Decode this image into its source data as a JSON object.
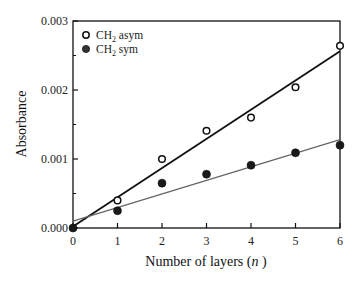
{
  "chart_data": {
    "type": "scatter",
    "title": "",
    "xlabel": "Number of layers (n)",
    "ylabel": "Absorbance",
    "xlim": [
      0,
      6
    ],
    "ylim": [
      0.0,
      0.003
    ],
    "x_ticks": [
      "0",
      "1",
      "2",
      "3",
      "4",
      "5",
      "6"
    ],
    "y_ticks": [
      "0.000",
      "0.001",
      "0.002",
      "0.003"
    ],
    "grid": false,
    "legend_position": "upper left",
    "x": [
      0,
      1,
      2,
      3,
      4,
      5,
      6
    ],
    "series": [
      {
        "name": "CH2 asym",
        "marker": "open-circle",
        "values": [
          0.0,
          0.0004,
          0.001,
          0.00141,
          0.0016,
          0.00204,
          0.00264
        ],
        "fit_line": {
          "x": [
            0,
            6
          ],
          "y": [
            2e-05,
            0.00256
          ],
          "style": "solid",
          "color": "#111111"
        }
      },
      {
        "name": "CH2 sym",
        "marker": "filled-circle",
        "values": [
          0.0,
          0.00025,
          0.00065,
          0.00078,
          0.00091,
          0.00109,
          0.0012
        ],
        "fit_line": {
          "x": [
            0,
            6
          ],
          "y": [
            0.0001,
            0.00128
          ],
          "style": "solid-thin",
          "color": "#666666"
        }
      }
    ]
  },
  "legend": {
    "items": [
      {
        "label_main": "CH",
        "label_sub": "2",
        "label_rest": " asym"
      },
      {
        "label_main": "CH",
        "label_sub": "2",
        "label_rest": " sym"
      }
    ]
  },
  "axes": {
    "xlabel_main": "Number of layers (",
    "xlabel_var": "n",
    "xlabel_end": " )",
    "ylabel": "Absorbance"
  }
}
